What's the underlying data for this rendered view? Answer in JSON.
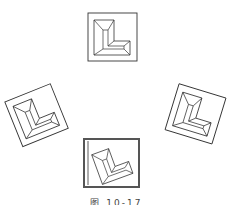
{
  "figure": {
    "caption": "图 10-17",
    "stroke_color": "#333333",
    "highlight_border_color": "#555555",
    "background": "#ffffff"
  },
  "tiles": [
    {
      "id": "top",
      "position": "top",
      "rotation_deg": 0,
      "selected": false
    },
    {
      "id": "left",
      "position": "left",
      "rotation_deg": -22,
      "selected": false
    },
    {
      "id": "right",
      "position": "right",
      "rotation_deg": 17,
      "selected": false
    },
    {
      "id": "bottom",
      "position": "bottom",
      "rotation_deg": 0,
      "selected": true
    }
  ]
}
